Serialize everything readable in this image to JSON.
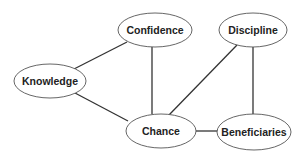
{
  "diagram": {
    "type": "undirected-graph",
    "nodes": [
      {
        "id": "confidence",
        "label": "Confidence",
        "cx": 155,
        "cy": 30,
        "rx": 37,
        "ry": 17
      },
      {
        "id": "discipline",
        "label": "Discipline",
        "cx": 253,
        "cy": 30,
        "rx": 34,
        "ry": 17
      },
      {
        "id": "knowledge",
        "label": "Knowledge",
        "cx": 50,
        "cy": 81,
        "rx": 36,
        "ry": 17
      },
      {
        "id": "chance",
        "label": "Chance",
        "cx": 161,
        "cy": 131,
        "rx": 35,
        "ry": 17
      },
      {
        "id": "beneficiaries",
        "label": "Beneficiaries",
        "cx": 254,
        "cy": 132,
        "rx": 37,
        "ry": 18
      }
    ],
    "edges": [
      {
        "from": "confidence",
        "to": "knowledge",
        "x1": 127,
        "y1": 42,
        "x2": 74,
        "y2": 69
      },
      {
        "from": "confidence",
        "to": "chance",
        "x1": 152,
        "y1": 47,
        "x2": 152,
        "y2": 114
      },
      {
        "from": "knowledge",
        "to": "chance",
        "x1": 75,
        "y1": 93,
        "x2": 128,
        "y2": 121
      },
      {
        "from": "discipline",
        "to": "chance",
        "x1": 237,
        "y1": 45,
        "x2": 169,
        "y2": 115
      },
      {
        "from": "discipline",
        "to": "beneficiaries",
        "x1": 253,
        "y1": 47,
        "x2": 253,
        "y2": 114
      },
      {
        "from": "chance",
        "to": "beneficiaries",
        "x1": 196,
        "y1": 131,
        "x2": 218,
        "y2": 131
      }
    ],
    "colors": {
      "edge": "#333333",
      "node_border": "#555555",
      "node_fill": "#ffffff",
      "text": "#222222"
    }
  }
}
